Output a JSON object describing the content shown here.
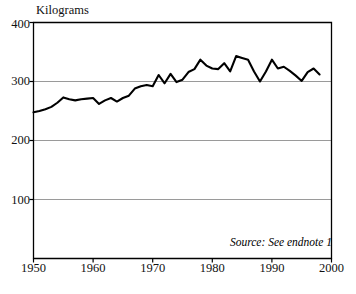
{
  "chart_data": {
    "type": "line",
    "title": "",
    "subtitle": "",
    "xlabel": "",
    "ylabel": "Kilograms",
    "ylim": [
      0,
      400
    ],
    "xlim": [
      1950,
      2000
    ],
    "yticks": [
      100,
      200,
      300,
      400
    ],
    "xticks": [
      1950,
      1960,
      1970,
      1980,
      1990,
      2000
    ],
    "grid": "horizontal",
    "legend": "none",
    "annotations": [
      {
        "name": "source-note",
        "text": "Source: See endnote 1",
        "position": "bottom-right",
        "style": "italic"
      }
    ],
    "series": [
      {
        "name": "Kilograms per person",
        "color": "#000000",
        "x": [
          1950,
          1951,
          1952,
          1953,
          1954,
          1955,
          1956,
          1957,
          1958,
          1959,
          1960,
          1961,
          1962,
          1963,
          1964,
          1965,
          1966,
          1967,
          1968,
          1969,
          1970,
          1971,
          1972,
          1973,
          1974,
          1975,
          1976,
          1977,
          1978,
          1979,
          1980,
          1981,
          1982,
          1983,
          1984,
          1985,
          1986,
          1987,
          1988,
          1989,
          1990,
          1991,
          1992,
          1993,
          1994,
          1995,
          1996,
          1997,
          1998
        ],
        "values": [
          248,
          250,
          253,
          257,
          264,
          273,
          270,
          268,
          270,
          271,
          272,
          262,
          268,
          272,
          266,
          272,
          276,
          288,
          292,
          294,
          292,
          311,
          297,
          313,
          299,
          303,
          316,
          321,
          337,
          327,
          322,
          321,
          331,
          317,
          343,
          340,
          337,
          317,
          300,
          317,
          337,
          322,
          325,
          318,
          310,
          301,
          316,
          322,
          312
        ]
      }
    ]
  },
  "axis": {
    "y_unit_label": "Kilograms",
    "y_tick_labels": [
      "400",
      "300",
      "200",
      "100"
    ],
    "x_tick_labels": [
      "1950",
      "1960",
      "1970",
      "1980",
      "1990",
      "2000"
    ]
  },
  "colors": {
    "line": "#000000",
    "grid": "#9a9a9a",
    "frame": "#000000",
    "background": "#ffffff"
  }
}
